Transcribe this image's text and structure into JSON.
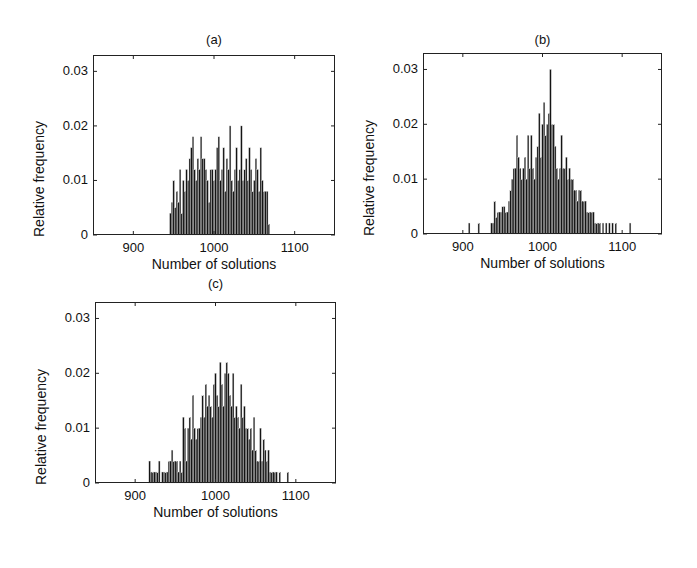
{
  "figure": {
    "panels": [
      {
        "id": "a",
        "title": "(a)",
        "xlabel": "Number of solutions",
        "ylabel": "Relative frequency"
      },
      {
        "id": "b",
        "title": "(b)",
        "xlabel": "Number of solutions",
        "ylabel": "Relative frequency"
      },
      {
        "id": "c",
        "title": "(c)",
        "xlabel": "Number of solutions",
        "ylabel": "Relative frequency"
      }
    ],
    "yticks": [
      "0",
      "0.01",
      "0.02",
      "0.03"
    ],
    "xticks": [
      "900",
      "1000",
      "1100"
    ],
    "bar_color": "#141414",
    "axis_color": "#222222"
  },
  "chart_data": [
    {
      "type": "bar",
      "title": "(a)",
      "xlabel": "Number of solutions",
      "ylabel": "Relative frequency",
      "xlim": [
        850,
        1150
      ],
      "ylim": [
        0,
        0.033
      ],
      "xticks": [
        900,
        1000,
        1100
      ],
      "yticks": [
        0,
        0.01,
        0.02,
        0.03
      ],
      "grid": false,
      "x": [
        946,
        948,
        950,
        952,
        954,
        956,
        958,
        960,
        962,
        964,
        966,
        968,
        970,
        972,
        974,
        976,
        978,
        980,
        982,
        984,
        986,
        988,
        990,
        992,
        994,
        996,
        998,
        1000,
        1002,
        1004,
        1006,
        1008,
        1010,
        1012,
        1014,
        1016,
        1018,
        1020,
        1022,
        1024,
        1026,
        1028,
        1030,
        1032,
        1034,
        1036,
        1038,
        1040,
        1042,
        1044,
        1046,
        1048,
        1050,
        1052,
        1054,
        1056,
        1058,
        1060,
        1062,
        1064,
        1066,
        1068
      ],
      "values": [
        0.004,
        0.006,
        0.01,
        0.005,
        0.008,
        0.006,
        0.012,
        0.004,
        0.01,
        0.008,
        0.012,
        0.01,
        0.014,
        0.016,
        0.018,
        0.012,
        0.01,
        0.014,
        0.012,
        0.018,
        0.014,
        0.014,
        0.012,
        0.01,
        0.006,
        0.012,
        0.012,
        0.01,
        0.012,
        0.016,
        0.018,
        0.01,
        0.012,
        0.016,
        0.008,
        0.014,
        0.012,
        0.02,
        0.01,
        0.008,
        0.012,
        0.016,
        0.01,
        0.012,
        0.02,
        0.01,
        0.012,
        0.014,
        0.01,
        0.016,
        0.012,
        0.008,
        0.01,
        0.014,
        0.012,
        0.008,
        0.016,
        0.01,
        0.008,
        0.008,
        0.008,
        0.002
      ]
    },
    {
      "type": "bar",
      "title": "(b)",
      "xlabel": "Number of solutions",
      "ylabel": "Relative frequency",
      "xlim": [
        850,
        1150
      ],
      "ylim": [
        0,
        0.033
      ],
      "xticks": [
        900,
        1000,
        1100
      ],
      "yticks": [
        0,
        0.01,
        0.02,
        0.03
      ],
      "grid": false,
      "x": [
        908,
        920,
        936,
        938,
        940,
        942,
        944,
        946,
        948,
        950,
        952,
        954,
        956,
        958,
        960,
        962,
        964,
        966,
        968,
        970,
        972,
        974,
        976,
        978,
        980,
        982,
        984,
        986,
        988,
        990,
        992,
        994,
        996,
        998,
        1000,
        1002,
        1004,
        1006,
        1008,
        1010,
        1012,
        1014,
        1016,
        1018,
        1020,
        1022,
        1024,
        1026,
        1028,
        1030,
        1032,
        1034,
        1036,
        1038,
        1040,
        1042,
        1044,
        1046,
        1048,
        1050,
        1052,
        1054,
        1056,
        1058,
        1060,
        1062,
        1064,
        1066,
        1068,
        1070,
        1072,
        1076,
        1080,
        1084,
        1088,
        1092,
        1110
      ],
      "values": [
        0.002,
        0.002,
        0.002,
        0.002,
        0.006,
        0.003,
        0.004,
        0.004,
        0.004,
        0.005,
        0.005,
        0.004,
        0.004,
        0.006,
        0.008,
        0.01,
        0.012,
        0.012,
        0.018,
        0.014,
        0.012,
        0.01,
        0.012,
        0.014,
        0.01,
        0.018,
        0.012,
        0.018,
        0.012,
        0.01,
        0.014,
        0.016,
        0.022,
        0.014,
        0.02,
        0.024,
        0.018,
        0.02,
        0.022,
        0.03,
        0.02,
        0.02,
        0.016,
        0.012,
        0.01,
        0.012,
        0.018,
        0.012,
        0.012,
        0.014,
        0.01,
        0.012,
        0.01,
        0.01,
        0.008,
        0.008,
        0.006,
        0.008,
        0.008,
        0.006,
        0.006,
        0.006,
        0.004,
        0.004,
        0.004,
        0.004,
        0.004,
        0.002,
        0.002,
        0.002,
        0.002,
        0.002,
        0.002,
        0.002,
        0.002,
        0.002,
        0.002
      ]
    },
    {
      "type": "bar",
      "title": "(c)",
      "xlabel": "Number of solutions",
      "ylabel": "Relative frequency",
      "xlim": [
        850,
        1150
      ],
      "ylim": [
        0,
        0.033
      ],
      "xticks": [
        900,
        1000,
        1100
      ],
      "yticks": [
        0,
        0.01,
        0.02,
        0.03
      ],
      "grid": false,
      "x": [
        918,
        920,
        922,
        924,
        926,
        928,
        930,
        934,
        936,
        938,
        940,
        942,
        944,
        946,
        948,
        950,
        952,
        954,
        956,
        958,
        960,
        962,
        964,
        966,
        968,
        970,
        972,
        974,
        976,
        978,
        980,
        982,
        984,
        986,
        988,
        990,
        992,
        994,
        996,
        998,
        1000,
        1002,
        1004,
        1006,
        1008,
        1010,
        1012,
        1014,
        1016,
        1018,
        1020,
        1022,
        1024,
        1026,
        1028,
        1030,
        1032,
        1034,
        1036,
        1038,
        1040,
        1042,
        1044,
        1046,
        1048,
        1050,
        1052,
        1054,
        1056,
        1058,
        1060,
        1062,
        1064,
        1066,
        1068,
        1070,
        1072,
        1074,
        1076,
        1080,
        1090
      ],
      "values": [
        0.004,
        0.002,
        0.002,
        0.002,
        0.002,
        0.002,
        0.004,
        0.002,
        0.002,
        0.002,
        0.002,
        0.004,
        0.004,
        0.006,
        0.004,
        0.004,
        0.004,
        0.002,
        0.004,
        0.002,
        0.012,
        0.01,
        0.004,
        0.01,
        0.012,
        0.008,
        0.016,
        0.01,
        0.008,
        0.01,
        0.01,
        0.012,
        0.016,
        0.012,
        0.018,
        0.014,
        0.016,
        0.014,
        0.012,
        0.018,
        0.02,
        0.016,
        0.014,
        0.022,
        0.018,
        0.014,
        0.02,
        0.022,
        0.02,
        0.016,
        0.014,
        0.02,
        0.012,
        0.014,
        0.012,
        0.01,
        0.018,
        0.012,
        0.014,
        0.01,
        0.01,
        0.008,
        0.01,
        0.006,
        0.012,
        0.006,
        0.004,
        0.004,
        0.01,
        0.004,
        0.008,
        0.006,
        0.004,
        0.006,
        0.002,
        0.002,
        0.002,
        0.002,
        0.002,
        0.002,
        0.002
      ]
    }
  ]
}
